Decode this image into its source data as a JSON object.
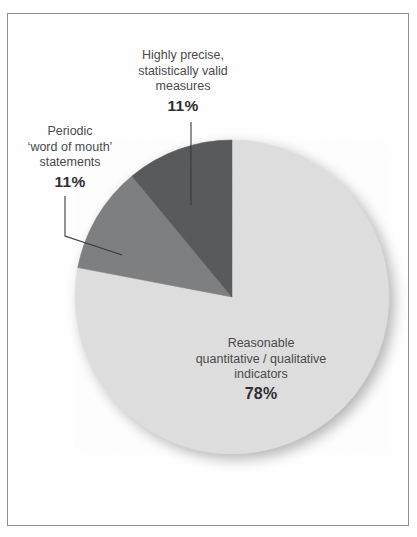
{
  "figure": {
    "frame_color": "#8d8f91",
    "background": "#ffffff",
    "cut_title": ""
  },
  "chart_data": {
    "type": "pie",
    "title": "",
    "subtitle": "",
    "xlabel": "",
    "ylabel": "",
    "legend_position": "none",
    "grid": false,
    "units": "percent",
    "total": 100,
    "start_angle_deg": 90,
    "direction": "counterclockwise",
    "categories": [
      "Highly precise, statistically valid measures",
      "Periodic 'word of mouth' statements",
      "Reasonable quantitative / qualitative indicators"
    ],
    "values": [
      11,
      11,
      78
    ],
    "colors": [
      "#58595b",
      "#7c7e80",
      "#dedede"
    ],
    "slices": [
      {
        "id": "precise",
        "name": "Highly precise, statistically valid measures",
        "value": 11,
        "percent_label": "11%",
        "color": "#58595b",
        "label_lines": [
          "Highly precise,",
          "statistically valid",
          "measures"
        ],
        "leader": "vertical"
      },
      {
        "id": "periodic",
        "name": "Periodic 'word of mouth' statements",
        "value": 11,
        "percent_label": "11%",
        "color": "#7c7e80",
        "label_lines": [
          "Periodic",
          "‘word of mouth’",
          "statements"
        ],
        "leader": "elbow"
      },
      {
        "id": "reasonable",
        "name": "Reasonable quantitative / qualitative indicators",
        "value": 78,
        "percent_label": "78%",
        "color": "#dedede",
        "label_lines": [
          "Reasonable",
          "quantitative / qualitative",
          "indicators"
        ],
        "leader": "none"
      }
    ]
  },
  "labels": {
    "precise": {
      "line1": "Highly precise,",
      "line2": "statistically valid",
      "line3": "measures",
      "percent": "11%"
    },
    "periodic": {
      "line1": "Periodic",
      "line2": "‘word of mouth’",
      "line3": "statements",
      "percent": "11%"
    },
    "reasonable": {
      "line1": "Reasonable",
      "line2": "quantitative / qualitative",
      "line3": "indicators",
      "percent": "78%"
    }
  }
}
